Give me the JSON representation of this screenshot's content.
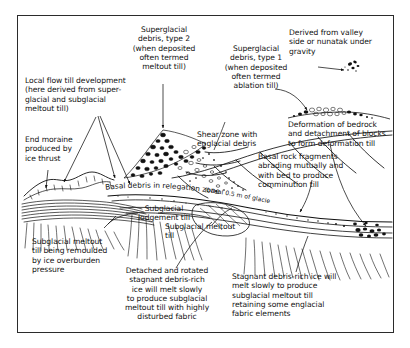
{
  "figure": {
    "background_color": "#ffffff",
    "frame_color": "#2b2b2b",
    "ink_color": "#111111"
  },
  "annotations": {
    "superglacial_type2": "Superglacial\ndebris, type 2\n(when deposited\noften termed\nmeltout till)",
    "local_flow_till": "Local flow till development\n(here derived from super-\nglacial and subglacial\nmeltout till)",
    "end_moraine": "End moraine\nproduced by\nice thrust",
    "superglacial_type1": "Superglacial\ndebris, type 1\n(when deposited\noften termed\nablation till)",
    "derived_from_valley": "Derived from valley\nside or nunatak under\ngravity",
    "shear_zone": "Shear zone with\nenglacial debris",
    "deformation_bedrock": "Deformation of bedrock\nand detachment of blocks\nto form deformation till",
    "basal_rock_fragments": "Basal rock fragments\nabrading mutually and\nwith bed to produce\ncomminution till",
    "subglacial_lodgement": "Subglacial\nlodgement till",
    "subglacial_meltout_short": "Subglacial meltout\ntill",
    "subglacial_meltout_remoulded": "Subglacial meltout\ntill being remoulded\nby ice overburden\npressure",
    "detached_rotated": "Detached and rotated\nstagnant debris-rich\nice will melt slowly\nto produce subglacial\nmeltout till with highly\ndisturbed fabric",
    "stagnant_debris": "Stagnant debris-rich ice will\nmelt slowly to produce\nsubglacial meltout till\nretaining some englacial\nfabric elements",
    "basal_debris_curved_main": "Basal debris in relegation zone",
    "basal_debris_curved_sub": "(basal 0.5 m of glacier)"
  }
}
